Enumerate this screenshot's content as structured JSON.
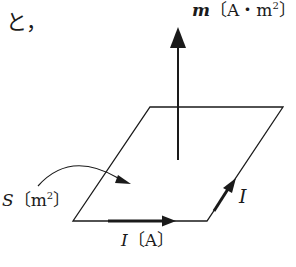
{
  "intro_text": "と，",
  "labels": {
    "moment_symbol": "m",
    "moment_unit_prefix": "〔A・m",
    "moment_unit_exp": "2",
    "moment_unit_suffix": "〕",
    "area_symbol": "S",
    "area_unit_prefix": "〔m",
    "area_unit_exp": "2",
    "area_unit_suffix": "〕",
    "current_symbol": "I",
    "current_unit": "〔A〕",
    "side_current_symbol": "I"
  },
  "colors": {
    "line": "#1a1a1a",
    "background": "#ffffff"
  }
}
